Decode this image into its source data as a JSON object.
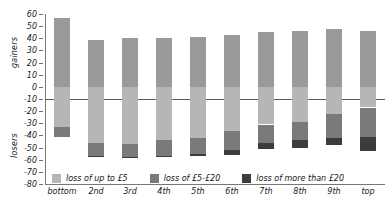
{
  "chart_data": {
    "type": "bar",
    "subtype": "stacked-diverging",
    "title": "",
    "xlabel": "",
    "ylabel": "",
    "ylim": [
      -80,
      60
    ],
    "yticks": [
      60,
      50,
      40,
      30,
      20,
      10,
      0,
      -10,
      -20,
      -30,
      -40,
      -50,
      -60,
      -70,
      -80
    ],
    "grid": false,
    "legend_position": "inside-bottom",
    "axis_titles": {
      "upper": "gainers",
      "lower": "losers"
    },
    "categories": [
      "bottom",
      "2nd",
      "3rd",
      "4th",
      "5th",
      "6th",
      "7th",
      "8th",
      "9th",
      "top"
    ],
    "series": [
      {
        "name": "gainers",
        "color": "#9a9a9a",
        "values": [
          57,
          39,
          40,
          40,
          41,
          43,
          45,
          46,
          48,
          46
        ]
      },
      {
        "name": "loss of up to £5",
        "color": "#b6b6b6",
        "values": [
          -33,
          -46,
          -47,
          -44,
          -42,
          -36,
          -31,
          -29,
          -22,
          -17
        ]
      },
      {
        "name": "loss of £5-£20",
        "color": "#7a7a7a",
        "values": [
          -8,
          -11,
          -11,
          -13,
          -13,
          -16,
          -15,
          -15,
          -20,
          -24
        ]
      },
      {
        "name": "loss of more than £20",
        "color": "#3c3c3c",
        "values": [
          0,
          -1,
          -1,
          -1,
          -2,
          -4,
          -5,
          -6,
          -6,
          -12
        ]
      }
    ],
    "legend": [
      {
        "label": "loss of up to £5",
        "color": "#b6b6b6"
      },
      {
        "label": "loss of £5-£20",
        "color": "#7a7a7a"
      },
      {
        "label": "loss of more than £20",
        "color": "#3c3c3c"
      }
    ]
  }
}
